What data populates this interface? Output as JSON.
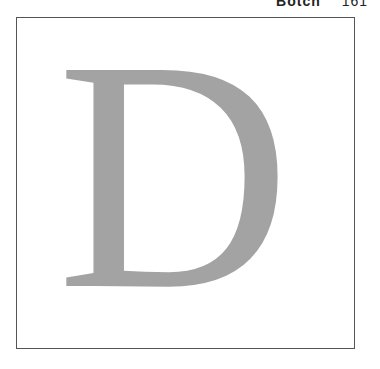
{
  "running_head": {
    "title": "Botch",
    "page_number": "161"
  },
  "figure": {
    "dropcap_letter": "D",
    "letter_color": "#a3a3a3",
    "border_color": "#555555"
  }
}
